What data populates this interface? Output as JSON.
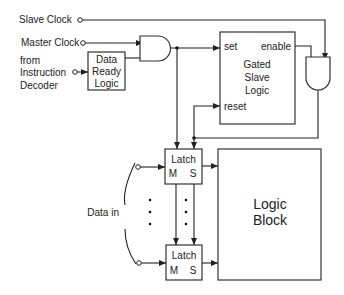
{
  "diagram": {
    "type": "block-diagram",
    "title": "",
    "inputs": {
      "slave_clock": "Slave Clock",
      "master_clock": "Master Clock",
      "from_decoder": [
        "from",
        "Instruction",
        "Decoder"
      ],
      "data_in": "Data in"
    },
    "blocks": {
      "data_ready": [
        "Data",
        "Ready",
        "Logic"
      ],
      "gated_slave": {
        "lines": [
          "Gated",
          "Slave",
          "Logic"
        ],
        "port_set": "set",
        "port_reset": "reset",
        "port_enable": "enable"
      },
      "latch_top": {
        "title": "Latch",
        "m": "M",
        "s": "S"
      },
      "latch_bottom": {
        "title": "Latch",
        "m": "M",
        "s": "S"
      },
      "logic_block": [
        "Logic",
        "Block"
      ]
    },
    "gates": [
      {
        "id": "and-master",
        "type": "AND",
        "inputs": [
          "Master Clock",
          "Data Ready Logic"
        ],
        "output": "set / Latch M"
      },
      {
        "id": "and-slave",
        "type": "AND",
        "inputs": [
          "Slave Clock",
          "enable"
        ],
        "output": "reset / Latch S"
      }
    ],
    "ellipsis": "•"
  }
}
